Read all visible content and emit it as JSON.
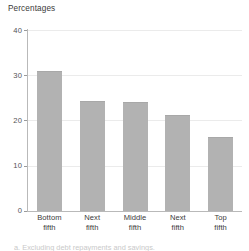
{
  "chart_data": {
    "type": "bar",
    "title": "Percentages",
    "xlabel": "",
    "ylabel": "",
    "categories": [
      "Bottom fifth",
      "Next fifth",
      "Middle fifth",
      "Next fifth",
      "Top fifth"
    ],
    "category_lines": [
      [
        "Bottom",
        "fifth"
      ],
      [
        "Next",
        "fifth"
      ],
      [
        "Middle",
        "fifth"
      ],
      [
        "Next",
        "fifth"
      ],
      [
        "Top",
        "fifth"
      ]
    ],
    "values": [
      31,
      24.3,
      24,
      21.2,
      16.3
    ],
    "ylim": [
      0,
      40
    ],
    "yticks": [
      0,
      10,
      20,
      30,
      40
    ],
    "ytick_labels": [
      "0",
      "10",
      "20",
      "30",
      "40"
    ],
    "grid": true,
    "grid_axis": "y",
    "legend": null,
    "bar_color": "#b2b2b2",
    "gridline_color": "#ebebeb",
    "axis_color": "#b9b9b9",
    "text_color": "#3a3a3a"
  },
  "footnote": {
    "text": "a. Excluding debt repayments and savings.",
    "note": "clipped at bottom edge of image"
  }
}
